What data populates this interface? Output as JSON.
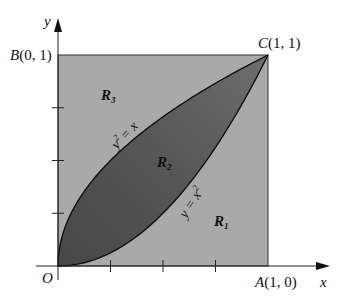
{
  "figure": {
    "type": "region-diagram",
    "colors": {
      "outer_region": "#a9a9a9",
      "lens_light": "#6e6e6e",
      "lens_dark": "#4a4a4a",
      "axis": "#222222",
      "background": "#ffffff"
    },
    "axes": {
      "x_label": "x",
      "y_label": "y",
      "origin_label": "O",
      "x_ticks": [
        0.25,
        0.5,
        0.75
      ],
      "y_ticks": [
        0.25,
        0.5,
        0.75
      ]
    },
    "points": {
      "A": {
        "name": "A",
        "coords": "(1, 0)"
      },
      "B": {
        "name": "B",
        "coords": "(0, 1)"
      },
      "C": {
        "name": "C",
        "coords": "(1, 1)"
      }
    },
    "curves": {
      "upper": {
        "label_lhs": "y",
        "label_exp": "2",
        "label_rhs": "= x"
      },
      "lower": {
        "label_lhs": "y = x",
        "label_exp": "2"
      }
    },
    "regions": {
      "R1": {
        "letter": "R",
        "sub": "1"
      },
      "R2": {
        "letter": "R",
        "sub": "2"
      },
      "R3": {
        "letter": "R",
        "sub": "3"
      }
    }
  }
}
